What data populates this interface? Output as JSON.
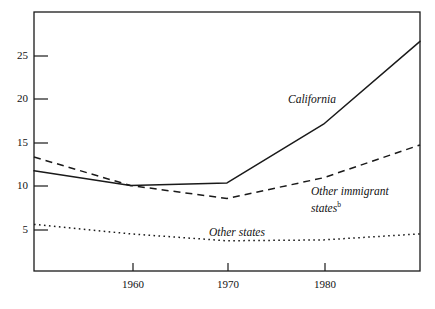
{
  "chart_data": {
    "type": "line",
    "title": "",
    "subtitle": "",
    "xlabel": "",
    "ylabel": "",
    "xlim": [
      1950,
      1990
    ],
    "ylim": [
      0,
      30
    ],
    "grid": false,
    "legend_position": "inline-annotations",
    "x_ticks": [
      1960,
      1970,
      1980
    ],
    "x_tick_labels": [
      "1960",
      "1970",
      "1980"
    ],
    "y_ticks": [
      5,
      10,
      15,
      20,
      25
    ],
    "y_tick_labels": [
      "5",
      "10",
      "15",
      "20",
      "25"
    ],
    "series": [
      {
        "name": "California",
        "style": "solid",
        "color": "#1a1a1a",
        "x": [
          1950,
          1960,
          1970,
          1980,
          1990
        ],
        "values": [
          11.6,
          9.9,
          10.2,
          17.0,
          26.6
        ]
      },
      {
        "name": "Other immigrant states",
        "footnote": "b",
        "style": "dashed",
        "color": "#1a1a1a",
        "x": [
          1950,
          1960,
          1970,
          1980,
          1990
        ],
        "values": [
          13.2,
          9.9,
          8.4,
          10.8,
          14.6
        ]
      },
      {
        "name": "Other states",
        "style": "dotted",
        "color": "#1a1a1a",
        "x": [
          1950,
          1960,
          1970,
          1980,
          1990
        ],
        "values": [
          5.4,
          4.3,
          3.5,
          3.6,
          4.3
        ]
      }
    ],
    "annotations": [
      {
        "text": "California",
        "x": 1976,
        "y": 20.5
      },
      {
        "text": "Other immigrant",
        "x": 1981,
        "y": 10.2
      },
      {
        "text": "states",
        "x": 1981,
        "y": 8.7,
        "sup": "b"
      },
      {
        "text": "Other states",
        "x": 1968,
        "y": 5.2
      }
    ]
  },
  "axis": {
    "y_labels": [
      "25",
      "20",
      "15",
      "10",
      "5"
    ],
    "x_labels": [
      "1960",
      "1970",
      "1980"
    ]
  },
  "labels": {
    "california": "California",
    "other_immigrant_line1": "Other immigrant",
    "other_immigrant_line2": "states",
    "other_immigrant_sup": "b",
    "other_states": "Other states"
  }
}
